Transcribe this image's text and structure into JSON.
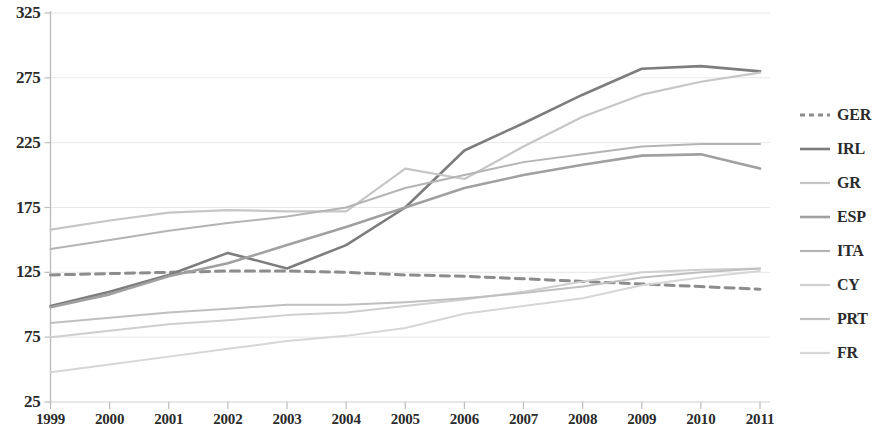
{
  "chart_data": {
    "type": "line",
    "title": "",
    "subtitle": "",
    "xlabel": "",
    "ylabel": "",
    "x": [
      1999,
      2000,
      2001,
      2002,
      2003,
      2004,
      2005,
      2006,
      2007,
      2008,
      2009,
      2010,
      2011
    ],
    "xtick_labels": [
      "1999",
      "2000",
      "2001",
      "2002",
      "2003",
      "2004",
      "2005",
      "2006",
      "2007",
      "2008",
      "2009",
      "2010",
      "2011"
    ],
    "ytick_labels": [
      "25",
      "75",
      "125",
      "175",
      "225",
      "275",
      "325"
    ],
    "yticks": [
      25,
      75,
      125,
      175,
      225,
      275,
      325
    ],
    "ylim": [
      25,
      325
    ],
    "xlim": [
      1999,
      2011
    ],
    "grid": true,
    "legend_position": "right",
    "series": [
      {
        "name": "GER",
        "color": "#8c8c8c",
        "style": "dashed",
        "width": 3.0,
        "values": [
          123,
          124,
          125,
          126,
          126,
          125,
          123,
          122,
          120,
          118,
          116,
          114,
          112
        ]
      },
      {
        "name": "IRL",
        "color": "#7d7d7d",
        "style": "solid",
        "width": 2.6,
        "values": [
          99,
          110,
          123,
          140,
          128,
          146,
          175,
          219,
          240,
          262,
          282,
          284,
          280
        ]
      },
      {
        "name": "GR",
        "color": "#c6c6c6",
        "style": "solid",
        "width": 2.2,
        "values": [
          158,
          165,
          171,
          173,
          172,
          172,
          205,
          197,
          222,
          245,
          262,
          272,
          279
        ]
      },
      {
        "name": "ESP",
        "color": "#a0a0a0",
        "style": "solid",
        "width": 2.6,
        "values": [
          98,
          108,
          122,
          132,
          146,
          160,
          175,
          190,
          200,
          208,
          215,
          216,
          205
        ]
      },
      {
        "name": "ITA",
        "color": "#b4b4b4",
        "style": "solid",
        "width": 2.0,
        "values": [
          143,
          150,
          157,
          163,
          168,
          175,
          190,
          200,
          210,
          216,
          222,
          224,
          224
        ]
      },
      {
        "name": "CY",
        "color": "#cfcfcf",
        "style": "solid",
        "width": 2.0,
        "values": [
          75,
          80,
          85,
          88,
          92,
          94,
          99,
          104,
          110,
          118,
          125,
          127,
          128
        ]
      },
      {
        "name": "PRT",
        "color": "#c0c0c0",
        "style": "solid",
        "width": 2.0,
        "values": [
          86,
          90,
          94,
          97,
          100,
          100,
          102,
          105,
          109,
          114,
          121,
          125,
          128
        ]
      },
      {
        "name": "FR",
        "color": "#d6d6d6",
        "style": "solid",
        "width": 2.0,
        "values": [
          48,
          54,
          60,
          66,
          72,
          76,
          82,
          93,
          99,
          105,
          115,
          121,
          126
        ]
      }
    ]
  },
  "legend": {
    "items": [
      {
        "label": "GER"
      },
      {
        "label": "IRL"
      },
      {
        "label": "GR"
      },
      {
        "label": "ESP"
      },
      {
        "label": "ITA"
      },
      {
        "label": "CY"
      },
      {
        "label": "PRT"
      },
      {
        "label": "FR"
      }
    ]
  },
  "axes": {
    "y_labels": [
      "325",
      "275",
      "225",
      "175",
      "125",
      "75",
      "25"
    ],
    "x_labels": [
      "1999",
      "2000",
      "2001",
      "2002",
      "2003",
      "2004",
      "2005",
      "2006",
      "2007",
      "2008",
      "2009",
      "2010",
      "2011"
    ]
  }
}
